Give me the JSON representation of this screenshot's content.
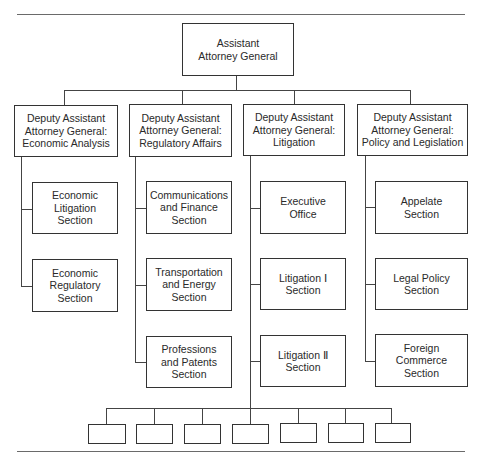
{
  "chart": {
    "top": {
      "label": "Assistant\nAttorney General",
      "lines": [
        "Assistant",
        "Attorney General"
      ]
    },
    "deputies": [
      {
        "lines": [
          "Deputy Assistant",
          "Attorney General:",
          "Economic Analysis"
        ],
        "sections": [
          {
            "lines": [
              "Economic",
              "Litigation",
              "Section"
            ]
          },
          {
            "lines": [
              "Economic",
              "Regulatory",
              "Section"
            ]
          }
        ]
      },
      {
        "lines": [
          "Deputy Assistant",
          "Attorney General:",
          "Regulatory Affairs"
        ],
        "sections": [
          {
            "lines": [
              "Communications",
              "and Finance",
              "Section"
            ]
          },
          {
            "lines": [
              "Transportation",
              "and Energy",
              "Section"
            ]
          },
          {
            "lines": [
              "Professions",
              "and Patents",
              "Section"
            ]
          }
        ]
      },
      {
        "lines": [
          "Deputy Assistant",
          "Attorney General:",
          "Litigation"
        ],
        "sections": [
          {
            "lines": [
              "Executive",
              "Office"
            ]
          },
          {
            "lines": [
              "Litigation Ⅰ",
              "Section"
            ]
          },
          {
            "lines": [
              "Litigation Ⅱ",
              "Section"
            ]
          }
        ]
      },
      {
        "lines": [
          "Deputy Assistant",
          "Attorney General:",
          "Policy and Legislation"
        ],
        "sections": [
          {
            "lines": [
              "Appelate",
              "Section"
            ]
          },
          {
            "lines": [
              "Legal Policy",
              "Section"
            ]
          },
          {
            "lines": [
              "Foreign",
              "Commerce",
              "Section"
            ]
          }
        ]
      }
    ],
    "unlabeled_field_offices_count": 7
  }
}
